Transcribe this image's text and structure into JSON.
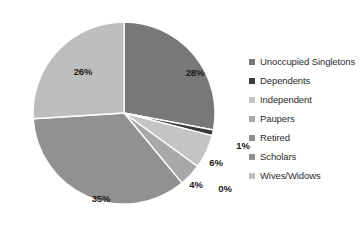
{
  "chart_data": {
    "type": "pie",
    "title": "",
    "subtitle": "",
    "xlabel": "",
    "ylabel": "",
    "legend_position": "right",
    "grid": false,
    "start_angle_deg": 0,
    "direction": "clockwise",
    "categories": [
      "Unoccupied Singletons",
      "Dependents",
      "Independent",
      "Paupers",
      "Retired",
      "Scholars",
      "Wives/Widows"
    ],
    "values": [
      28,
      1,
      6,
      4,
      0,
      35,
      26
    ],
    "data_labels": [
      "28%",
      "1%",
      "6%",
      "4%",
      "0%",
      "35%",
      "26%"
    ],
    "colors": [
      "#787878",
      "#3a3a3a",
      "#c4c4c4",
      "#a8a8a8",
      "#8f8f8f",
      "#919191",
      "#bdbdbd"
    ],
    "slice_label_positions": [
      {
        "x": 175,
        "y": 65
      },
      {
        "x": 223,
        "y": 138
      },
      {
        "x": 196,
        "y": 155
      },
      {
        "x": 176,
        "y": 177
      },
      {
        "x": 205,
        "y": 181
      },
      {
        "x": 81,
        "y": 191
      },
      {
        "x": 63,
        "y": 64
      }
    ]
  },
  "chart": {
    "background_color": "#ffffff",
    "label_color": "#1a1a1a",
    "legend_text_color": "#2b2b2b",
    "separator_color": "#ffffff"
  },
  "legend": {
    "items": [
      {
        "label": "Unoccupied Singletons",
        "color": "#787878"
      },
      {
        "label": "Dependents",
        "color": "#3a3a3a"
      },
      {
        "label": "Independent",
        "color": "#c4c4c4"
      },
      {
        "label": "Paupers",
        "color": "#a8a8a8"
      },
      {
        "label": "Retired",
        "color": "#8f8f8f"
      },
      {
        "label": "Scholars",
        "color": "#919191"
      },
      {
        "label": "Wives/Widows",
        "color": "#bdbdbd"
      }
    ]
  }
}
